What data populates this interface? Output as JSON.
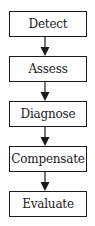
{
  "diagram": {
    "type": "flowchart",
    "direction": "top-to-bottom",
    "steps": [
      {
        "label": "Detect"
      },
      {
        "label": "Assess"
      },
      {
        "label": "Diagnose"
      },
      {
        "label": "Compensate"
      },
      {
        "label": "Evaluate"
      }
    ],
    "connectors": [
      {
        "from": "Detect",
        "to": "Assess"
      },
      {
        "from": "Assess",
        "to": "Diagnose"
      },
      {
        "from": "Diagnose",
        "to": "Compensate"
      },
      {
        "from": "Compensate",
        "to": "Evaluate"
      }
    ],
    "colors": {
      "stroke": "#1a1a1a",
      "fill": "#ffffff",
      "text": "#1a1a1a"
    }
  }
}
